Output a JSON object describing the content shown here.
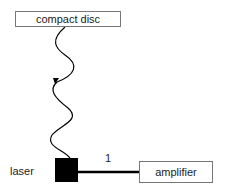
{
  "diagram": {
    "nodes": {
      "compact_disc": {
        "label": "compact disc"
      },
      "laser": {
        "label": "laser"
      },
      "amplifier": {
        "label": "amplifier"
      }
    },
    "edges": [
      {
        "from": "laser",
        "to": "compact_disc",
        "style": "wavy",
        "arrow": "toward laser"
      },
      {
        "from": "laser",
        "to": "amplifier",
        "style": "thick",
        "label": "1"
      }
    ],
    "colors": {
      "line": "#000000",
      "box_border": "#777777",
      "laser_fill": "#000000"
    }
  }
}
